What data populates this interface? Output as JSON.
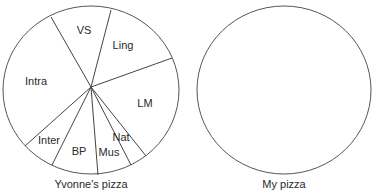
{
  "chart_data": [
    {
      "type": "pie",
      "title": "Yvonne's pizza",
      "categories": [
        "VS",
        "Ling",
        "LM",
        "Nat",
        "Mus",
        "BP",
        "Inter",
        "Intra"
      ],
      "values": [
        12,
        14,
        24,
        3,
        6,
        8,
        7,
        26
      ],
      "unit": "approx. % of pie",
      "legend": "none (labels inside slices)",
      "center": [
        91,
        87
      ],
      "radius": [
        88,
        85
      ],
      "spoke_endpoints": [
        [
          51,
          17
        ],
        [
          111,
          10
        ],
        [
          172,
          58
        ],
        [
          146,
          156
        ],
        [
          131,
          165
        ],
        [
          98,
          175
        ],
        [
          52,
          165
        ],
        [
          25,
          146
        ]
      ],
      "label_positions": {
        "VS": [
          84,
          34
        ],
        "Ling": [
          123,
          49
        ],
        "LM": [
          145,
          107
        ],
        "Nat": [
          121,
          141
        ],
        "Mus": [
          109,
          156
        ],
        "BP": [
          79,
          155
        ],
        "Inter": [
          49,
          144
        ],
        "Intra": [
          36,
          85
        ]
      }
    },
    {
      "type": "pie",
      "title": "My pizza",
      "categories": [],
      "values": [],
      "note": "empty circle, no slices",
      "center": [
        284,
        90
      ],
      "radius": [
        87,
        84
      ]
    }
  ],
  "captions": {
    "left": "Yvonne's pizza",
    "right": "My pizza"
  }
}
